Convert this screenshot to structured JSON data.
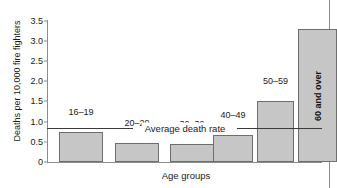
{
  "chart_data": {
    "type": "bar",
    "title": "",
    "xlabel": "Age groups",
    "ylabel": "Deaths per 10,000 fire fighters",
    "categories": [
      "16–19",
      "20–29",
      "30–39",
      "40–49",
      "50–59",
      "60 and over"
    ],
    "values": [
      0.75,
      0.48,
      0.45,
      0.68,
      1.5,
      3.3
    ],
    "ylim": [
      0,
      3.5
    ],
    "yticks": [
      0,
      0.5,
      1.0,
      1.5,
      2.0,
      2.5,
      3.0,
      3.5
    ],
    "ytick_labels": [
      "0",
      "0.5",
      "1.0",
      "1.5",
      "2.0",
      "2.5",
      "3.0",
      "3.5"
    ],
    "grid": false,
    "legend": "none",
    "annotations": [
      {
        "name": "average-death-rate",
        "label": "Average death rate",
        "type": "horizontal-reference-line",
        "value": 0.85
      }
    ],
    "series_colors": {
      "bar_fill": "#c6c6c6",
      "bar_edge": "#6e6e6e",
      "axis": "#8c8c8c",
      "reference_line": "#3b3b3b",
      "text": "#1a1a1a"
    }
  },
  "figure": {
    "background": "#ffffff"
  }
}
